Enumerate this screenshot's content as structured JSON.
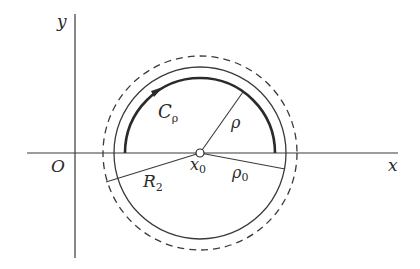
{
  "figure": {
    "type": "geometric-diagram",
    "colors": {
      "ink": "#333333",
      "background": "#ffffff"
    }
  },
  "axes": {
    "x_label": "x",
    "y_label": "y",
    "origin_label": "O"
  },
  "labels": {
    "contour": {
      "main": "C",
      "sub": "ρ"
    },
    "center": {
      "main": "x",
      "sub": "0"
    },
    "radius_rho": "ρ",
    "radius_rho0": {
      "main": "ρ",
      "sub": "0"
    },
    "radius_R2": {
      "main": "R",
      "sub": "2"
    }
  },
  "geometry": {
    "center": [
      200,
      153
    ],
    "arc_radius": 75,
    "solid_circle_radius": 86,
    "dashed_circle_radius": 97,
    "arrow_direction": "counterclockwise-from-right-over-top (drawn arrow points right along upper arc)"
  }
}
